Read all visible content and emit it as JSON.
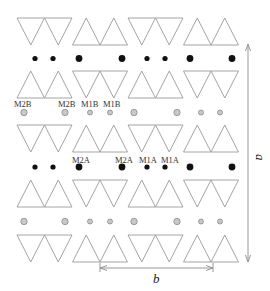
{
  "diagram": {
    "triangle_rows": [
      {
        "row": 1,
        "pattern": [
          "down",
          "up",
          "down",
          "up"
        ]
      },
      {
        "row": 2,
        "pattern": [
          "up",
          "down",
          "up",
          "down"
        ]
      },
      {
        "row": 3,
        "pattern": [
          "down",
          "up",
          "down",
          "up"
        ]
      },
      {
        "row": 4,
        "pattern": [
          "up",
          "down",
          "up",
          "down"
        ]
      },
      {
        "row": 5,
        "pattern": [
          "down",
          "up",
          "down",
          "up"
        ]
      }
    ],
    "atom_rows": [
      {
        "row": 1,
        "type": "black",
        "sizes": [
          "small",
          "small",
          "large",
          "large",
          "small",
          "small",
          "large",
          "large"
        ]
      },
      {
        "row": 2,
        "type": "gray",
        "sizes": [
          "large",
          "large",
          "small",
          "small",
          "large",
          "large",
          "small",
          "small"
        ]
      },
      {
        "row": 3,
        "type": "black",
        "sizes": [
          "small",
          "small",
          "large",
          "large",
          "small",
          "small",
          "large",
          "large"
        ]
      },
      {
        "row": 4,
        "type": "gray",
        "sizes": [
          "large",
          "large",
          "small",
          "small",
          "large",
          "large",
          "small",
          "small"
        ]
      }
    ],
    "site_labels": {
      "gray_row": [
        "M2B",
        "M2B",
        "M1B",
        "M1B"
      ],
      "black_row": [
        "M2A",
        "M2A",
        "M1A",
        "M1A"
      ]
    },
    "colors": {
      "black_atom": "#111111",
      "gray_atom": "#c8c8c8",
      "triangle_stroke": "#9a9a9a"
    },
    "axes": {
      "vertical_label": "a",
      "horizontal_label": "b"
    }
  }
}
